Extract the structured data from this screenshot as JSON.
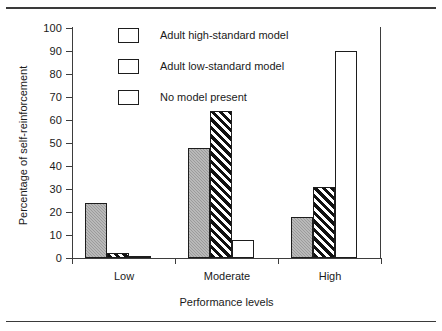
{
  "chart_data": {
    "type": "bar",
    "title": "",
    "xlabel": "Performance levels",
    "ylabel": "Percentage of self-reinforcement",
    "categories": [
      "Low",
      "Moderate",
      "High"
    ],
    "series": [
      {
        "name": "Adult high-standard model",
        "pattern": "white",
        "values": [
          1,
          8,
          90
        ]
      },
      {
        "name": "Adult low-standard model",
        "pattern": "hatch",
        "values": [
          2,
          64,
          31
        ]
      },
      {
        "name": "No model present",
        "pattern": "gray",
        "values": [
          24,
          48,
          18
        ]
      }
    ],
    "series_draw_order": [
      "No model present",
      "Adult low-standard model",
      "Adult high-standard model"
    ],
    "ylim": [
      0,
      100
    ],
    "yticks": [
      0,
      10,
      20,
      30,
      40,
      50,
      60,
      70,
      80,
      90,
      100
    ],
    "ytick_labels": [
      "0",
      "10",
      "20",
      "30",
      "40",
      "50",
      "60",
      "70",
      "80",
      "90",
      "100"
    ],
    "grid": false,
    "legend_position": "top-center"
  },
  "legend": {
    "items": [
      {
        "label": "Adult high-standard model",
        "pattern": "white"
      },
      {
        "label": "Adult low-standard model",
        "pattern": "hatch"
      },
      {
        "label": "No model present",
        "pattern": "gray"
      }
    ]
  },
  "colors": {
    "axis": "#3d3d3d",
    "bar_outline": "#1d1d1d",
    "gray_fill": "#9b9b9b",
    "hatch_fill": "#111111",
    "white_fill": "#ffffff",
    "rule": "#3a3a3a",
    "text": "#1a1a1a"
  }
}
